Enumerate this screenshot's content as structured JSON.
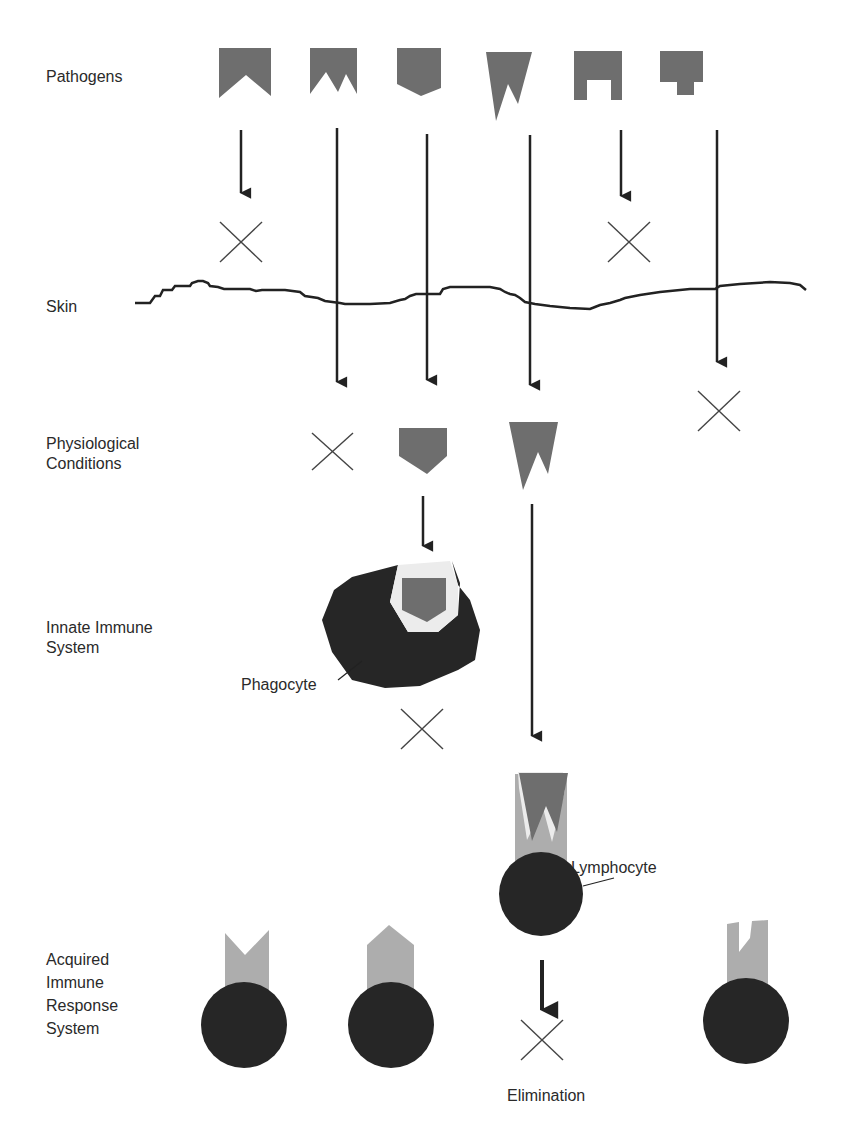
{
  "stages": {
    "pathogens": "Pathogens",
    "skin": "Skin",
    "physiological": "Physiological\nConditions",
    "innate": "Innate Immune\nSystem",
    "acquired": "Acquired\nImmune\nResponse\nSystem"
  },
  "annotations": {
    "phagocyte": "Phagocyte",
    "lymphocyte": "Lymphocyte",
    "elimination": "Elimination"
  },
  "pathogens": [
    {
      "id": "p1",
      "shape": "notch-v",
      "outcome": "blocked-by-skin"
    },
    {
      "id": "p2",
      "shape": "double-spike",
      "outcome": "blocked-by-physiological-conditions"
    },
    {
      "id": "p3",
      "shape": "pentagon",
      "outcome": "eliminated-by-phagocyte"
    },
    {
      "id": "p4",
      "shape": "w-spike",
      "outcome": "eliminated-by-lymphocyte"
    },
    {
      "id": "p5",
      "shape": "notch-square",
      "outcome": "blocked-by-skin"
    },
    {
      "id": "p6",
      "shape": "t-block",
      "outcome": "blocked-after-skin"
    }
  ],
  "colors": {
    "pathogen": "#6e6e6e",
    "cell": "#262626",
    "receptor": "#adadad",
    "line": "#222222"
  }
}
